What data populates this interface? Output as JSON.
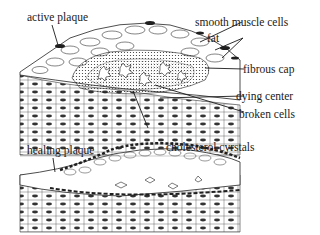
{
  "figure": {
    "type": "atherosclerotic plaque cross-section illustration",
    "panels": [
      {
        "name": "active plaque panel",
        "label": "active plaque"
      },
      {
        "name": "healing plaque panel",
        "label": "healing plaque"
      }
    ]
  },
  "labels": {
    "active_plaque": "active plaque",
    "smooth_muscle_cells": "smooth muscle cells",
    "fat": "fat",
    "fibrous_cap": "fibrous cap",
    "dying_center": "dying center",
    "broken_cells": "broken cells",
    "healing_plaque": "healing plaque",
    "cholesterol_crystals": "cholesterol cyrstals"
  },
  "colors": {
    "ink": "#1a1a1a",
    "background": "#ffffff",
    "dark_stipple": "#2a2a2a"
  }
}
